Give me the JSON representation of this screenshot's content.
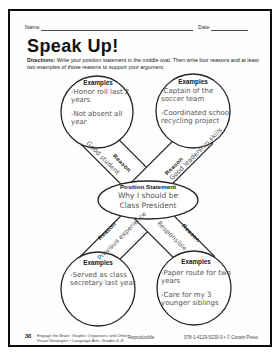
{
  "page": {
    "name_label": "Name",
    "date_label": "Date",
    "title": "Speak Up!",
    "directions_label": "Directions:",
    "directions_text": " Write your position statement in the middle oval. Then write four reasons and at least two examples of those reasons to support your argument."
  },
  "organizer": {
    "reason_label": "Reason",
    "examples_label": "Examples",
    "center": {
      "header": "Position Statement",
      "statement": "Why I should be Class President"
    },
    "branches": {
      "top_left": {
        "reason": "Good student",
        "items": [
          "-Honor roll last 2 years",
          "-Not absent all year"
        ]
      },
      "top_right": {
        "reason": "Good leadership skills",
        "items": [
          "-Captain of the soccer team",
          "-Coordinated school recycling project"
        ]
      },
      "bottom_left": {
        "reason": "Previous experience",
        "items": [
          "-Served as class secretary last year"
        ]
      },
      "bottom_right": {
        "reason": "Responsible",
        "items": [
          "-Paper route for two years",
          "-Care for my 3 younger siblings"
        ]
      }
    }
  },
  "footer": {
    "page_number": "38",
    "source_line1": "Engage the Brain: Graphic Organizers and Other",
    "source_line2": "Visual Strategies • Language Arts, Grades 6–8",
    "reproducible": "Reproducible",
    "isbn": "978-1-4129-5230-9 • © Corwin Press"
  },
  "colors": {
    "ink": "#1c1c1c",
    "pencil": "#545454",
    "frame": "#0c0c0c"
  }
}
